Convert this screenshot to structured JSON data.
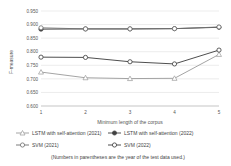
{
  "chart_data": {
    "type": "line",
    "title": "",
    "xlabel": "Minimum length of the corpus",
    "ylabel": "F-measure",
    "categories": [
      "1",
      "2",
      "3",
      "4",
      "5"
    ],
    "x": [
      1,
      2,
      3,
      4,
      5
    ],
    "ylim": [
      0.6,
      0.95
    ],
    "yticks": [
      "0.600",
      "0.650",
      "0.700",
      "0.750",
      "0.800",
      "0.850",
      "0.900",
      "0.950"
    ],
    "ytick_values": [
      0.6,
      0.65,
      0.7,
      0.75,
      0.8,
      0.85,
      0.9,
      0.95
    ],
    "grid": true,
    "legend_position": "bottom",
    "note": "(Numbers in parentheses are the year of the test data used.)",
    "series": [
      {
        "name": "LSTM with self-attention (2021)",
        "marker": "triangle-open",
        "color": "#9a9a9a",
        "values": [
          0.725,
          0.704,
          0.701,
          0.702,
          0.79
        ]
      },
      {
        "name": "LSTM with self-attention (2022)",
        "marker": "circle-filled",
        "color": "#404040",
        "values": [
          0.883,
          0.884,
          0.884,
          0.885,
          0.89
        ]
      },
      {
        "name": "SVM (2021)",
        "marker": "circle-open",
        "color": "#6e6e6e",
        "values": [
          0.888,
          0.884,
          0.884,
          0.885,
          0.891
        ]
      },
      {
        "name": "SVM (2022)",
        "marker": "circle-open",
        "color": "#3a3a3a",
        "values": [
          0.78,
          0.779,
          0.763,
          0.755,
          0.806
        ]
      }
    ]
  },
  "legend": {
    "row1": [
      {
        "label": "LSTM with self-attention (2021)",
        "marker": "triangle-open",
        "color": "#9a9a9a"
      },
      {
        "label": "LSTM with self-attention (2022)",
        "marker": "circle-filled",
        "color": "#404040"
      }
    ],
    "row2": [
      {
        "label": "SVM (2021)",
        "marker": "circle-open",
        "color": "#6e6e6e"
      },
      {
        "label": "SVM (2022)",
        "marker": "circle-open",
        "color": "#3a3a3a"
      }
    ]
  }
}
